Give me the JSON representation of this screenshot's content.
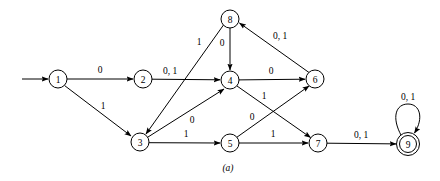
{
  "figure": {
    "caption": "(a)",
    "type": "state-transition-diagram",
    "colors": {
      "stroke": "#000000",
      "background": "#ffffff",
      "text": "#000000"
    },
    "nodes": [
      {
        "id": "1",
        "label": "1",
        "x": 58,
        "y": 79,
        "accepting": false,
        "start": true
      },
      {
        "id": "2",
        "label": "2",
        "x": 143,
        "y": 79,
        "accepting": false,
        "start": false
      },
      {
        "id": "3",
        "label": "3",
        "x": 140,
        "y": 142,
        "accepting": false,
        "start": false
      },
      {
        "id": "4",
        "label": "4",
        "x": 230,
        "y": 80,
        "accepting": false,
        "start": false
      },
      {
        "id": "5",
        "label": "5",
        "x": 230,
        "y": 143,
        "accepting": false,
        "start": false
      },
      {
        "id": "6",
        "label": "6",
        "x": 315,
        "y": 79,
        "accepting": false,
        "start": false
      },
      {
        "id": "7",
        "label": "7",
        "x": 318,
        "y": 143,
        "accepting": false,
        "start": false
      },
      {
        "id": "8",
        "label": "8",
        "x": 230,
        "y": 19,
        "accepting": false,
        "start": false
      },
      {
        "id": "9",
        "label": "9",
        "x": 408,
        "y": 144,
        "accepting": true,
        "start": false
      }
    ],
    "edges": [
      {
        "from": "start",
        "to": "1",
        "label": "",
        "label_x": 0,
        "label_y": 0
      },
      {
        "from": "1",
        "to": "2",
        "label": "0",
        "label_x": 100,
        "label_y": 70
      },
      {
        "from": "1",
        "to": "3",
        "label": "1",
        "label_x": 103,
        "label_y": 106
      },
      {
        "from": "2",
        "to": "4",
        "label": "0, 1",
        "label_x": 170,
        "label_y": 71
      },
      {
        "from": "8",
        "to": "3",
        "label": "1",
        "label_x": 199,
        "label_y": 42
      },
      {
        "from": "8",
        "to": "4",
        "label": "0",
        "label_x": 222,
        "label_y": 43
      },
      {
        "from": "3",
        "to": "4",
        "label": "0",
        "label_x": 192,
        "label_y": 120
      },
      {
        "from": "3",
        "to": "5",
        "label": "1",
        "label_x": 186,
        "label_y": 134
      },
      {
        "from": "4",
        "to": "6",
        "label": "0",
        "label_x": 271,
        "label_y": 71
      },
      {
        "from": "4",
        "to": "7",
        "label": "1",
        "label_x": 264,
        "label_y": 96
      },
      {
        "from": "5",
        "to": "6",
        "label": "0",
        "label_x": 252,
        "label_y": 117
      },
      {
        "from": "5",
        "to": "7",
        "label": "1",
        "label_x": 273,
        "label_y": 134
      },
      {
        "from": "6",
        "to": "8",
        "label": "0, 1",
        "label_x": 280,
        "label_y": 36
      },
      {
        "from": "7",
        "to": "9",
        "label": "0, 1",
        "label_x": 361,
        "label_y": 135
      },
      {
        "from": "9",
        "to": "9",
        "label": "0, 1",
        "label_x": 408,
        "label_y": 97
      }
    ]
  }
}
